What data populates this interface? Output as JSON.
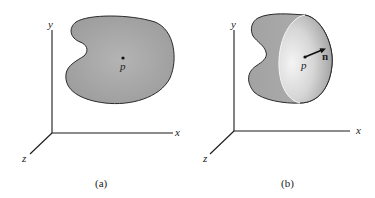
{
  "figure": {
    "panels": [
      {
        "id": "a",
        "caption": "(a)",
        "axes": {
          "x_label": "x",
          "y_label": "y",
          "z_label": "z"
        },
        "region": "flat-planar-region",
        "point_label": "p"
      },
      {
        "id": "b",
        "caption": "(b)",
        "axes": {
          "x_label": "x",
          "y_label": "y",
          "z_label": "z"
        },
        "region": "curved-surface",
        "point_label": "p",
        "normal_label": "n"
      }
    ],
    "colors": {
      "region_fill": "#a8a8a8",
      "outline": "#2a2a2a",
      "inner_surface_light": "#f2f2f2",
      "inner_surface_dark": "#9a9a9a"
    }
  }
}
